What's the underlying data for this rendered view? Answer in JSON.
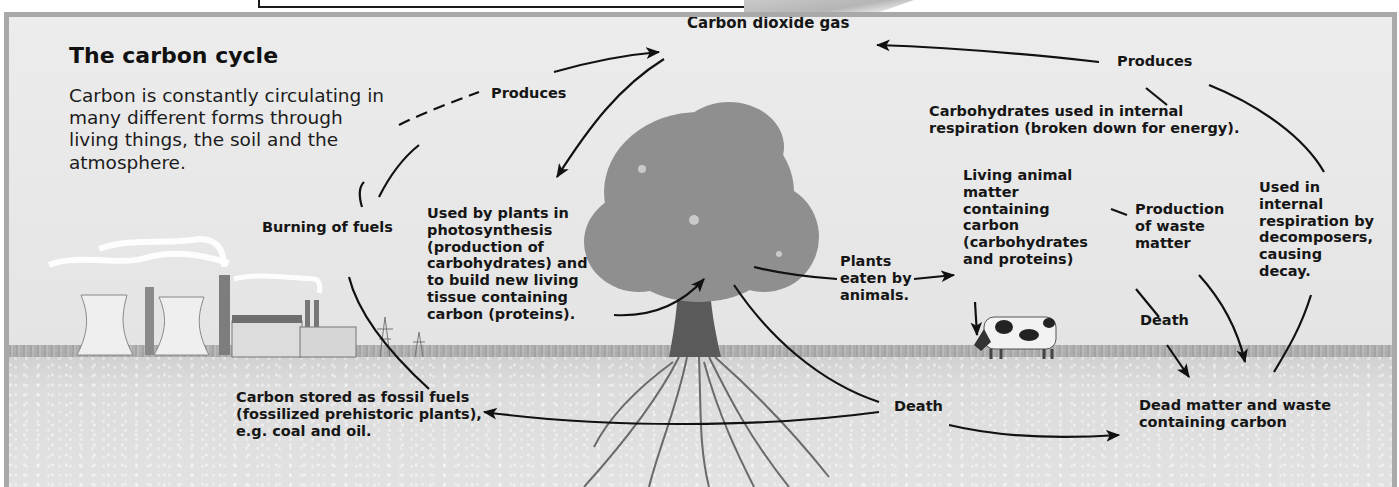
{
  "diagram": {
    "title": "The carbon cycle",
    "intro": "Carbon is constantly circulating in\nmany different forms through\nliving things, the soil and the\natmosphere.",
    "nodes": {
      "co2": "Carbon dioxide gas",
      "produces_left": "Produces",
      "produces_right": "Produces",
      "respiration_plants_animals": "Carbohydrates used in internal\nrespiration (broken down for energy).",
      "photosynthesis": "Used by plants in\nphotosynthesis\n(production of\ncarbohydrates) and\nto build new living\ntissue containing\ncarbon (proteins).",
      "burning": "Burning of fuels",
      "plants_eaten": "Plants\neaten by\nanimals.",
      "animal_matter": "Living animal\nmatter\ncontaining\ncarbon\n(carbohydrates\nand proteins)",
      "waste_production": "Production\nof waste\nmatter",
      "decomposers": "Used in\ninternal\nrespiration by\ndecomposers,\ncausing\ndecay.",
      "death_animal": "Death",
      "death_plant": "Death",
      "fossil_fuels": "Carbon stored as fossil fuels\n(fossilized prehistoric plants),\ne.g.  coal and oil.",
      "dead_matter": "Dead matter and waste\ncontaining carbon"
    },
    "edges": [
      {
        "from": "burning",
        "to": "co2",
        "label": "Produces"
      },
      {
        "from": "co2",
        "to": "photosynthesis"
      },
      {
        "from": "photosynthesis",
        "to": "tree"
      },
      {
        "from": "tree",
        "to": "plants_eaten"
      },
      {
        "from": "plants_eaten",
        "to": "animal_matter"
      },
      {
        "from": "animal_matter",
        "to": "cow"
      },
      {
        "from": "animal_matter",
        "to": "waste_production"
      },
      {
        "from": "waste_production",
        "to": "dead_matter"
      },
      {
        "from": "animal_matter",
        "to": "death_animal"
      },
      {
        "from": "death_animal",
        "to": "dead_matter"
      },
      {
        "from": "tree",
        "to": "death_plant"
      },
      {
        "from": "death_plant",
        "to": "fossil_fuels"
      },
      {
        "from": "death_plant",
        "to": "dead_matter"
      },
      {
        "from": "dead_matter",
        "to": "decomposers"
      },
      {
        "from": "decomposers",
        "to": "produces_right"
      },
      {
        "from": "produces_right",
        "to": "co2"
      },
      {
        "from": "respiration_plants_animals",
        "to": "produces_right"
      },
      {
        "from": "fossil_fuels",
        "to": "burning"
      }
    ],
    "illustrations": [
      "power-station",
      "oak-tree",
      "cow",
      "grassland"
    ],
    "colors": {
      "frame": "#a9a9a9",
      "background": "#ebebeb",
      "ink": "#161616",
      "foliage": "#8c8c8c"
    }
  }
}
